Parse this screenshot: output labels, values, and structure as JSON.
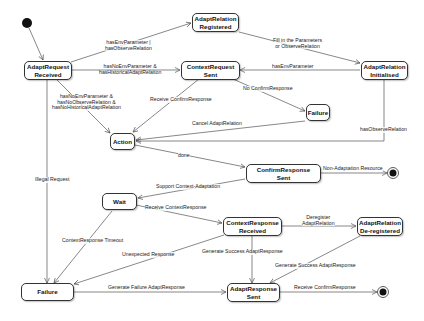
{
  "diagram": {
    "type": "state-machine",
    "initial_state": {
      "target": "AdaptRequest Received"
    },
    "states": [
      {
        "id": "s_req",
        "label_line1": "AdaptRequest",
        "label_line2": "Received"
      },
      {
        "id": "s_reg",
        "label_line1": "AdaptRelation",
        "label_line2": "Registered"
      },
      {
        "id": "s_ctx",
        "label_line1": "ContextRequest",
        "label_line2": "Sent"
      },
      {
        "id": "s_init",
        "label_line1": "AdaptRelation",
        "label_line2": "Initialised"
      },
      {
        "id": "s_fail1",
        "label_line1": "Failure",
        "label_line2": ""
      },
      {
        "id": "s_action",
        "label_line1": "Action",
        "label_line2": ""
      },
      {
        "id": "s_confirm",
        "label_line1": "ConfirmResponse",
        "label_line2": "Sent"
      },
      {
        "id": "s_wait",
        "label_line1": "Wait",
        "label_line2": ""
      },
      {
        "id": "s_ctxresp",
        "label_line1": "ContextResponse",
        "label_line2": "Received"
      },
      {
        "id": "s_dereg",
        "label_line1": "AdaptRelation",
        "label_line2": "De-registered"
      },
      {
        "id": "s_fail2",
        "label_line1": "Failure",
        "label_line2": ""
      },
      {
        "id": "s_adaptresp",
        "label_line1": "AdaptResponse",
        "label_line2": "Sent"
      }
    ],
    "transitions": [
      {
        "from": "AdaptRequest Received",
        "to": "AdaptRelation Registered",
        "label": "hasEnvParameter |\nhasObserveRelation"
      },
      {
        "from": "AdaptRequest Received",
        "to": "ContextRequest Sent",
        "label": "hasNoEnvParameter &\nhasHistoricalAdaptRelation"
      },
      {
        "from": "AdaptRequest Received",
        "to": "Action",
        "label": "hasNoEnvParameter &\nhasNoObserveRelation &\nhasNoHistoricalAdaptRelation"
      },
      {
        "from": "AdaptRequest Received",
        "to": "Failure",
        "label": "Illegal Request"
      },
      {
        "from": "AdaptRelation Registered",
        "to": "AdaptRelation Initialised",
        "label": "Fill in the Parameters\nor ObserveRelation"
      },
      {
        "from": "AdaptRelation Initialised",
        "to": "ContextRequest Sent",
        "label": "hasEnvParameter"
      },
      {
        "from": "AdaptRelation Initialised",
        "to": "Action",
        "label": "hasObserveRelation"
      },
      {
        "from": "ContextRequest Sent",
        "to": "Action",
        "label": "Receive ConfirmResponse"
      },
      {
        "from": "ContextRequest Sent",
        "to": "Failure",
        "label": "No ConfirmResponse"
      },
      {
        "from": "Failure",
        "to": "Action",
        "label": "Cancel AdaptRelation"
      },
      {
        "from": "Action",
        "to": "ConfirmResponse Sent",
        "label": "done"
      },
      {
        "from": "ConfirmResponse Sent",
        "to": "final",
        "label": "Non-Adaptation Resource"
      },
      {
        "from": "ConfirmResponse Sent",
        "to": "Wait",
        "label": "Support Context-Adaptation"
      },
      {
        "from": "Wait",
        "to": "ContextResponse Received",
        "label": "Receive ContextResponse"
      },
      {
        "from": "Wait",
        "to": "Failure",
        "label": "ContextResponse Timeout"
      },
      {
        "from": "ContextResponse Received",
        "to": "AdaptRelation De-registered",
        "label": "Deregister\nAdaptRelation"
      },
      {
        "from": "ContextResponse Received",
        "to": "Failure",
        "label": "Unexpected Response"
      },
      {
        "from": "ContextResponse Received",
        "to": "AdaptResponse Sent",
        "label": "Generate Success AdaptResponse"
      },
      {
        "from": "AdaptRelation De-registered",
        "to": "AdaptResponse Sent",
        "label": "Generate Success AdaptResponse"
      },
      {
        "from": "Failure",
        "to": "AdaptResponse Sent",
        "label": "Generate Failure AdaptResponse"
      },
      {
        "from": "AdaptResponse Sent",
        "to": "final",
        "label": "Receive ConfirmResponse"
      }
    ]
  },
  "labels": {
    "t_reg_1": "hasEnvParameter |",
    "t_reg_2": "hasObserveRelation",
    "t_ctx_1": "hasNoEnvParameter &",
    "t_ctx_2": "hasHistoricalAdaptRelation",
    "t_act_1": "hasNoEnvParameter &",
    "t_act_2": "hasNoObserveRelation &",
    "t_act_3": "hasNoHistoricalAdaptRelation",
    "t_illegal": "Illegal Request",
    "t_fill_1": "Fill in the Parameters",
    "t_fill_2": "or ObserveRelation",
    "t_hasenv": "hasEnvParameter",
    "t_hasobs": "hasObserveRelation",
    "t_rcv_confirm": "Receive ConfirmResponse",
    "t_no_confirm": "No ConfirmResponse",
    "t_cancel": "Cancel AdaptRelation",
    "t_done": "done",
    "t_nonadapt": "Non-Adaptation Resource",
    "t_support": "Support Context-Adaptation",
    "t_rcv_ctx": "Receive ContextResponse",
    "t_timeout": "ContextResponse Timeout",
    "t_dereg_1": "Deregister",
    "t_dereg_2": "AdaptRelation",
    "t_unexpected": "Unexpected Response",
    "t_gen_success_1": "Generate Success AdaptResponse",
    "t_gen_success_2": "Generate Success AdaptResponse",
    "t_gen_failure": "Generate Failure AdaptResponse",
    "t_rcv_confirm_2": "Receive ConfirmResponse"
  }
}
